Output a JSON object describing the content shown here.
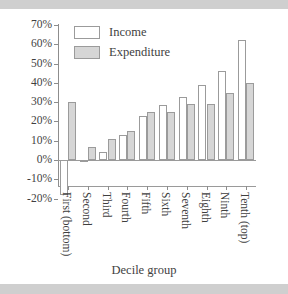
{
  "chart_data": {
    "type": "bar",
    "title": "",
    "subtitle": "",
    "xlabel": "Decile group",
    "ylabel": "",
    "categories": [
      "First (bottom)",
      "Second",
      "Third",
      "Fourth",
      "Fifth",
      "Sixth",
      "Seventh",
      "Eighth",
      "Ninth",
      "Tenth (top)"
    ],
    "series": [
      {
        "name": "Income",
        "color": "#ffffff",
        "values": [
          -18,
          -1,
          4,
          13,
          23,
          28.5,
          32.5,
          39,
          46,
          62
        ]
      },
      {
        "name": "Expenditure",
        "color": "#d6d6d6",
        "values": [
          30,
          7,
          11,
          15,
          25,
          25,
          29,
          29,
          35,
          40
        ]
      }
    ],
    "ylim": [
      -20,
      70
    ],
    "ytick_labels": [
      "70%",
      "60%",
      "50%",
      "40%",
      "30%",
      "20%",
      "10%",
      "0%",
      "-10%",
      "-20%"
    ],
    "ytick_values": [
      70,
      60,
      50,
      40,
      30,
      20,
      10,
      0,
      -10,
      -20
    ],
    "grid": false,
    "legend_position": "top-left",
    "legend": [
      "Income",
      "Expenditure"
    ]
  },
  "legend": {
    "income_label": "Income",
    "expenditure_label": "Expenditure"
  },
  "axes": {
    "x_title": "Decile group"
  }
}
